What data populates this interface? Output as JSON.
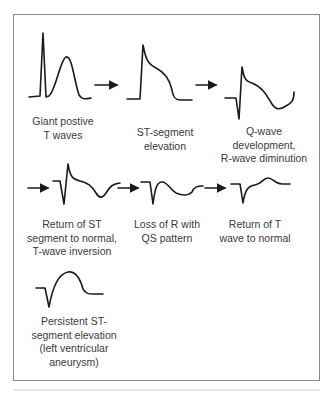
{
  "diagram": {
    "type": "ECG evolution of myocardial infarction",
    "stages": [
      {
        "id": "giant-positive-t-waves",
        "label_lines": [
          "Giant postive",
          "T waves"
        ]
      },
      {
        "id": "st-segment-elevation",
        "label_lines": [
          "ST-segment",
          "elevation"
        ]
      },
      {
        "id": "q-wave-development",
        "label_lines": [
          "Q-wave",
          "development,",
          "R-wave diminution"
        ]
      },
      {
        "id": "return-of-st-t-inversion",
        "label_lines": [
          "Return of ST",
          "segment to normal,",
          "T-wave inversion"
        ]
      },
      {
        "id": "loss-of-r-qs-pattern",
        "label_lines": [
          "Loss of R with",
          "QS pattern"
        ]
      },
      {
        "id": "return-of-t-wave",
        "label_lines": [
          "Return of T",
          "wave to normal"
        ]
      },
      {
        "id": "persistent-st-elevation",
        "label_lines": [
          "Persistent ST-",
          "segment elevation",
          "(left ventricular",
          "aneurysm)"
        ]
      }
    ],
    "arrows": [
      {
        "from": "giant-positive-t-waves",
        "to": "st-segment-elevation"
      },
      {
        "from": "st-segment-elevation",
        "to": "q-wave-development"
      },
      {
        "from": "q-wave-development",
        "to": "return-of-st-t-inversion"
      },
      {
        "from": "return-of-st-t-inversion",
        "to": "loss-of-r-qs-pattern"
      },
      {
        "from": "loss-of-r-qs-pattern",
        "to": "return-of-t-wave"
      }
    ],
    "colors": {
      "stroke": "#1a1a1a",
      "text": "#3a3a3a",
      "border": "#8a8a8a"
    }
  }
}
